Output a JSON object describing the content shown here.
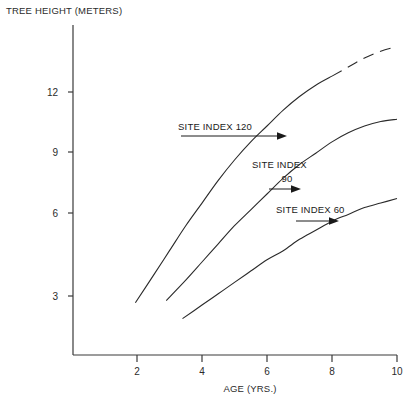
{
  "chart_data": {
    "type": "line",
    "title": "",
    "ylabel": "TREE HEIGHT (METERS)",
    "xlabel": "AGE (YRS.)",
    "xlim": [
      1,
      10
    ],
    "ylim": [
      0,
      14
    ],
    "xticks": [
      2,
      4,
      6,
      8,
      10
    ],
    "xtick_labels": [
      "2",
      "4",
      "6",
      "8",
      "10"
    ],
    "yticks": [
      3,
      6,
      9,
      12
    ],
    "ytick_labels": [
      "3",
      "6",
      "9",
      "12"
    ],
    "grid": false,
    "legend": "none",
    "annotations": [
      {
        "name": "site-index-120",
        "line1": "SITE INDEX 120",
        "line2": ""
      },
      {
        "name": "site-index-90",
        "line1": "SITE INDEX",
        "line2": "90"
      },
      {
        "name": "site-index-60",
        "line1": "SITE INDEX 60",
        "line2": ""
      }
    ],
    "series": [
      {
        "name": "SITE INDEX 120",
        "style": "solid-then-dashed",
        "x": [
          1.95,
          2.5,
          3.0,
          3.5,
          4.0,
          4.5,
          5.0,
          5.5,
          6.0,
          6.5,
          7.0,
          7.5,
          8.0
        ],
        "y": [
          2.7,
          3.9,
          5.0,
          6.1,
          7.1,
          8.1,
          9.0,
          9.8,
          10.5,
          11.2,
          11.8,
          12.3,
          12.7
        ],
        "dashed_x": [
          8.0,
          8.5,
          9.0,
          9.5,
          10.0
        ],
        "dashed_y": [
          12.7,
          13.1,
          13.5,
          13.8,
          14.0
        ]
      },
      {
        "name": "SITE INDEX 90",
        "style": "solid",
        "x": [
          2.9,
          3.5,
          4.0,
          4.5,
          5.0,
          5.5,
          6.0,
          6.5,
          7.0,
          7.5,
          8.0,
          8.5,
          9.0,
          9.5,
          10.0
        ],
        "y": [
          2.8,
          3.7,
          4.5,
          5.3,
          6.1,
          6.8,
          7.5,
          8.2,
          8.8,
          9.3,
          9.8,
          10.2,
          10.5,
          10.7,
          10.8
        ],
        "dashed_x": [],
        "dashed_y": []
      },
      {
        "name": "SITE INDEX 60",
        "style": "solid",
        "x": [
          3.4,
          4.0,
          4.5,
          5.0,
          5.5,
          6.0,
          6.5,
          7.0,
          7.5,
          8.0,
          8.5,
          9.0,
          9.5,
          10.0
        ],
        "y": [
          2.0,
          2.6,
          3.1,
          3.6,
          4.1,
          4.6,
          5.0,
          5.5,
          5.9,
          6.3,
          6.6,
          6.9,
          7.1,
          7.3
        ],
        "dashed_x": [],
        "dashed_y": []
      }
    ],
    "axis_color": "#3a3a3a",
    "line_color": "#2a2a2a"
  }
}
